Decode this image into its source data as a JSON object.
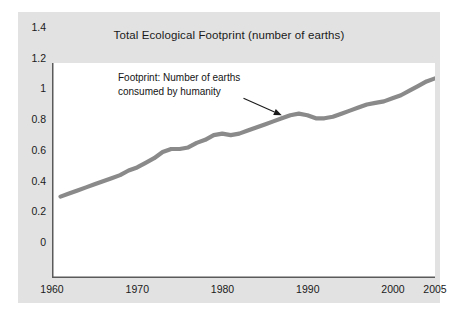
{
  "chart_data": {
    "type": "line",
    "title": "Total Ecological Footprint (number of earths)",
    "xlabel": "",
    "ylabel": "",
    "xlim": [
      1961,
      2005
    ],
    "ylim": [
      0,
      1.4
    ],
    "grid": false,
    "legend": null,
    "line_color": "#8a8a8a",
    "x_ticks": [
      "1960",
      "1970",
      "1980",
      "1990",
      "2000",
      "2005"
    ],
    "x_tick_values": [
      1960,
      1970,
      1980,
      1990,
      2000,
      2005
    ],
    "y_ticks": [
      "0",
      "0.2",
      "0.4",
      "0.6",
      "0.8",
      "1",
      "1.2",
      "1.4"
    ],
    "y_tick_values": [
      0,
      0.2,
      0.4,
      0.6,
      0.8,
      1,
      1.2,
      1.4
    ],
    "series": [
      {
        "name": "Footprint: Number of earths consumed by humanity",
        "x": [
          1961,
          1962,
          1963,
          1964,
          1965,
          1966,
          1967,
          1968,
          1969,
          1970,
          1971,
          1972,
          1973,
          1974,
          1975,
          1976,
          1977,
          1978,
          1979,
          1980,
          1981,
          1982,
          1983,
          1984,
          1985,
          1986,
          1987,
          1988,
          1989,
          1990,
          1991,
          1992,
          1993,
          1994,
          1995,
          1996,
          1997,
          1998,
          1999,
          2000,
          2001,
          2002,
          2003,
          2004,
          2005
        ],
        "values": [
          0.53,
          0.55,
          0.57,
          0.59,
          0.61,
          0.63,
          0.65,
          0.67,
          0.7,
          0.72,
          0.75,
          0.78,
          0.82,
          0.84,
          0.84,
          0.85,
          0.88,
          0.9,
          0.93,
          0.94,
          0.93,
          0.94,
          0.96,
          0.98,
          1.0,
          1.02,
          1.04,
          1.06,
          1.07,
          1.06,
          1.04,
          1.04,
          1.05,
          1.07,
          1.09,
          1.11,
          1.13,
          1.14,
          1.15,
          1.17,
          1.19,
          1.22,
          1.25,
          1.28,
          1.3
        ]
      }
    ],
    "annotations": [
      {
        "name": "footprint-annotation",
        "line1": "Footprint: Number of earths",
        "line2": "consumed by humanity",
        "arrow": {
          "from_x": 1982.5,
          "from_y": 1.17,
          "to_x": 1987.0,
          "to_y": 1.06
        }
      }
    ]
  }
}
